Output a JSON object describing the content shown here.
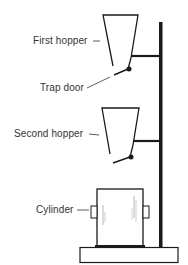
{
  "diagram": {
    "type": "apparatus",
    "labels": {
      "first_hopper": "First hopper",
      "trap_door": "Trap door",
      "second_hopper": "Second hopper",
      "cylinder": "Cylinder"
    },
    "components": [
      "First hopper",
      "Trap door",
      "Second hopper",
      "Cylinder",
      "Stand",
      "Base"
    ],
    "colors": {
      "line": "#1a1a1a",
      "text": "#333333",
      "background": "#ffffff"
    }
  }
}
